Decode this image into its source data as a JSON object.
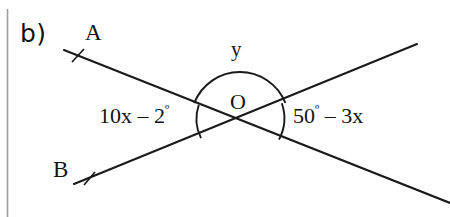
{
  "figure": {
    "part_label": "b)",
    "point_a_label": "A",
    "point_b_label": "B",
    "vertex_label": "O",
    "angle_top_label": "y",
    "angle_left_value": "10x",
    "angle_left_op": "–",
    "angle_left_number": "2",
    "angle_left_degree": "º",
    "angle_right_number": "50",
    "angle_right_degree": "º",
    "angle_right_op": "–",
    "angle_right_value": "3x",
    "angle_left_full": "10x – 2º",
    "angle_right_full": "50º – 3x",
    "stroke_color": "#1a1a1a",
    "margin_rule_color": "#9a9a9a",
    "background_color": "#ffffff"
  },
  "geometry": {
    "vertex": {
      "x": 240,
      "y": 121
    },
    "line_ao": {
      "x1": 64,
      "y1": 50,
      "x2": 450,
      "y2": 203
    },
    "line_bo": {
      "x1": 74,
      "y1": 184,
      "x2": 417,
      "y2": 44
    },
    "tick_a": {
      "x": 78,
      "y": 56
    },
    "tick_b": {
      "x": 89,
      "y": 179
    },
    "arc_top_radius": 48,
    "arc_left_radius": 42,
    "arc_right_radius": 45,
    "margin_rule_x": 7
  }
}
